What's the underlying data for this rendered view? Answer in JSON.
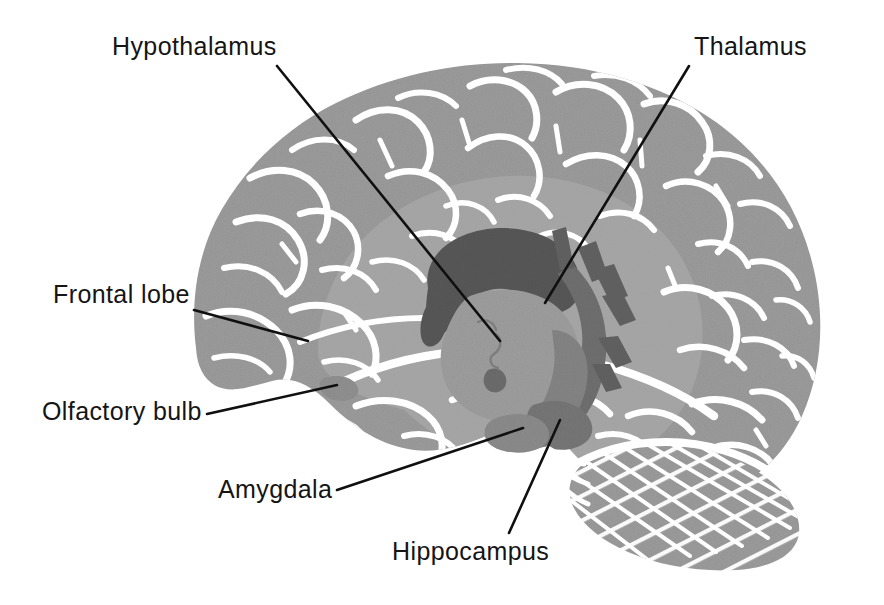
{
  "figure": {
    "width": 884,
    "height": 605,
    "background": "#ffffff"
  },
  "palette": {
    "background": "#ffffff",
    "cortex": "#9b9b9b",
    "cortex_inner": "#a5a5a5",
    "sulci": "#ffffff",
    "corpus_callosum": "#575757",
    "thalamus": "#9a9a9a",
    "fornix": "#6f6f6f",
    "brainstem": "#848484",
    "hippocampus": "#767676",
    "amygdala": "#8a8a8a",
    "cerebellum": "#9b9b9b",
    "cerebellum_folia": "#ffffff",
    "leader_line": "#101010",
    "label_text": "#151515"
  },
  "labels": [
    {
      "id": "hypothalamus",
      "text": "Hypothalamus",
      "text_x": 112,
      "text_y": 55,
      "anchor": "start",
      "leader": {
        "x1": 277,
        "y1": 66,
        "x2": 500,
        "y2": 341
      }
    },
    {
      "id": "thalamus",
      "text": "Thalamus",
      "text_x": 694,
      "text_y": 55,
      "anchor": "start",
      "leader": {
        "x1": 689,
        "y1": 66,
        "x2": 545,
        "y2": 303
      }
    },
    {
      "id": "frontal-lobe",
      "text": "Frontal lobe",
      "text_x": 53,
      "text_y": 303,
      "anchor": "start",
      "leader": {
        "x1": 194,
        "y1": 310,
        "x2": 308,
        "y2": 341
      }
    },
    {
      "id": "olfactory-bulb",
      "text": "Olfactory bulb",
      "text_x": 42,
      "text_y": 420,
      "anchor": "start",
      "leader": {
        "x1": 207,
        "y1": 414,
        "x2": 337,
        "y2": 385
      }
    },
    {
      "id": "amygdala",
      "text": "Amygdala",
      "text_x": 218,
      "text_y": 498,
      "anchor": "start",
      "leader": {
        "x1": 337,
        "y1": 490,
        "x2": 523,
        "y2": 428
      }
    },
    {
      "id": "hippocampus",
      "text": "Hippocampus",
      "text_x": 392,
      "text_y": 560,
      "anchor": "start",
      "leader": {
        "x1": 509,
        "y1": 533,
        "x2": 560,
        "y2": 420
      }
    }
  ],
  "structures": [
    {
      "id": "cerebral-cortex",
      "name": "Cerebral cortex"
    },
    {
      "id": "corpus-callosum",
      "name": "Corpus callosum"
    },
    {
      "id": "thalamus-body",
      "name": "Thalamus"
    },
    {
      "id": "hypothalamus-body",
      "name": "Hypothalamus"
    },
    {
      "id": "fornix",
      "name": "Fornix"
    },
    {
      "id": "brainstem",
      "name": "Brainstem"
    },
    {
      "id": "cerebellum",
      "name": "Cerebellum"
    },
    {
      "id": "amygdala-body",
      "name": "Amygdala"
    },
    {
      "id": "hippocampus-body",
      "name": "Hippocampus"
    },
    {
      "id": "olfactory-bulb-body",
      "name": "Olfactory bulb"
    },
    {
      "id": "frontal-lobe-region",
      "name": "Frontal lobe"
    }
  ]
}
